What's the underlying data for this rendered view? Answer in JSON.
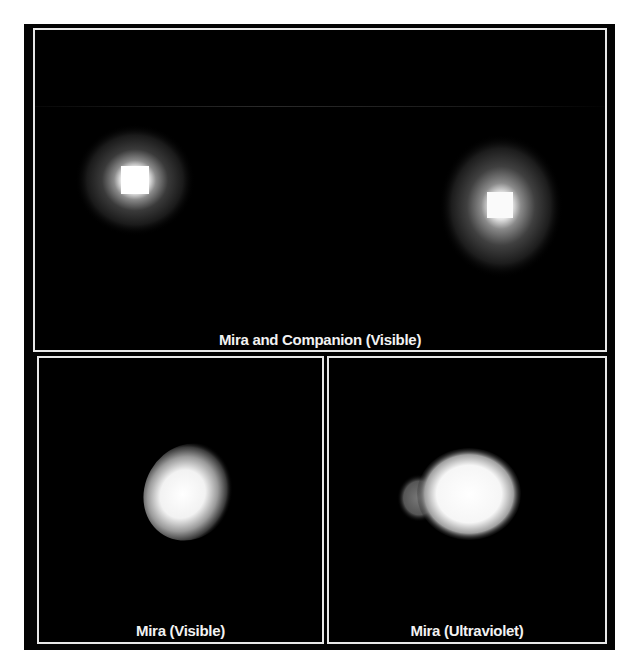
{
  "figure": {
    "panels": [
      {
        "id": "top",
        "caption": "Mira and Companion (Visible)"
      },
      {
        "id": "bottom-left",
        "caption": "Mira (Visible)"
      },
      {
        "id": "bottom-right",
        "caption": "Mira (Ultraviolet)"
      }
    ]
  },
  "colors": {
    "background": "#000000",
    "border": "#e8e8e8",
    "caption": "#f2f2f2",
    "page": "#ffffff"
  }
}
